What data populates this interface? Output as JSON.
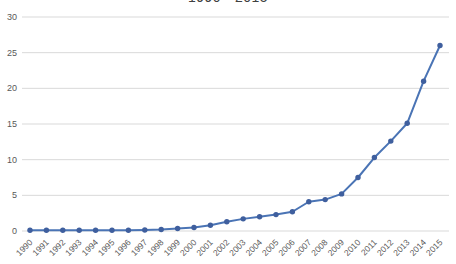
{
  "chart_data": {
    "type": "line",
    "title": "1990 - 2015",
    "x": [
      1990,
      1991,
      1992,
      1993,
      1994,
      1995,
      1996,
      1997,
      1998,
      1999,
      2000,
      2001,
      2002,
      2003,
      2004,
      2005,
      2006,
      2007,
      2008,
      2009,
      2010,
      2011,
      2012,
      2013,
      2014,
      2015
    ],
    "series": [
      {
        "name": "value",
        "values": [
          0.1,
          0.1,
          0.1,
          0.1,
          0.1,
          0.1,
          0.1,
          0.15,
          0.2,
          0.35,
          0.5,
          0.8,
          1.3,
          1.7,
          2.0,
          2.3,
          2.7,
          4.1,
          4.4,
          5.2,
          7.5,
          10.3,
          12.6,
          15.1,
          21,
          26
        ]
      }
    ],
    "xlabel": "",
    "ylabel": "",
    "ylim": [
      0,
      30
    ],
    "yticks": [
      0,
      5,
      10,
      15,
      20,
      25,
      30
    ],
    "grid": "horizontal",
    "legend": "none",
    "colors": {
      "line": "#4A74B5",
      "marker": "#3F5F9E",
      "gridline": "#D9D9D9",
      "tick_label": "#595959",
      "title": "#404040",
      "background": "#FFFFFF"
    }
  }
}
